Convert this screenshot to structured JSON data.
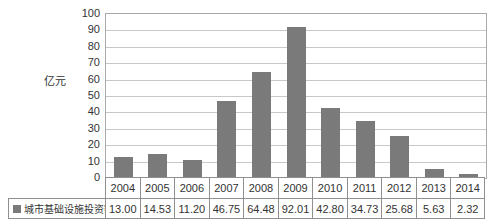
{
  "chart_data": {
    "type": "bar",
    "title": "",
    "xlabel": "",
    "ylabel": "亿元",
    "ylim": [
      0,
      100
    ],
    "ytick_step": 10,
    "ytick_labels": [
      "100",
      "90",
      "80",
      "70",
      "60",
      "50",
      "40",
      "30",
      "20",
      "10",
      "0"
    ],
    "grid": "horizontal",
    "legend_position": "bottom-left-table",
    "categories": [
      "2004",
      "2005",
      "2006",
      "2007",
      "2008",
      "2009",
      "2010",
      "2011",
      "2012",
      "2013",
      "2014"
    ],
    "series": [
      {
        "name": "城市基础设施投资额",
        "values": [
          13.0,
          14.53,
          11.2,
          46.75,
          64.48,
          92.01,
          42.8,
          34.73,
          25.68,
          5.63,
          2.32
        ],
        "value_labels": [
          "13.00",
          "14.53",
          "11.20",
          "46.75",
          "64.48",
          "92.01",
          "42.80",
          "34.73",
          "25.68",
          "5.63",
          "2.32"
        ]
      }
    ]
  },
  "legend": {
    "marker": "filled-square",
    "label": "城市基础设施投资额"
  },
  "colors": {
    "bar": "#7a7a7a",
    "gridline": "#c8c8c8",
    "plot_border": "#a8a8a8",
    "table_border": "#8f8f8f",
    "text": "#333333",
    "background": "#ffffff"
  }
}
